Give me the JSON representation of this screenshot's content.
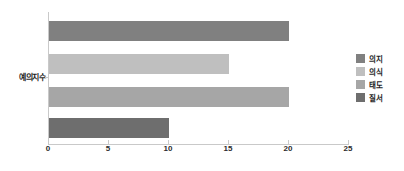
{
  "chart_data": {
    "type": "bar",
    "orientation": "horizontal",
    "title": "",
    "xlabel": "",
    "ylabel": "",
    "categories": [
      "예의지수"
    ],
    "xlim": [
      0,
      25
    ],
    "xticks": [
      0,
      5,
      10,
      15,
      20,
      25
    ],
    "xtick_labels": [
      "0",
      "5",
      "10",
      "15",
      "20",
      "25"
    ],
    "grid": false,
    "legend_position": "right",
    "series": [
      {
        "name": "의지",
        "values": [
          20
        ],
        "color": "#808080"
      },
      {
        "name": "의식",
        "values": [
          15
        ],
        "color": "#bfbfbf"
      },
      {
        "name": "태도",
        "values": [
          20
        ],
        "color": "#a6a6a6"
      },
      {
        "name": "질서",
        "values": [
          10
        ],
        "color": "#6e6e6e"
      }
    ]
  },
  "axis": {
    "category_label": "예의지수",
    "line_color": "#c9c9c9"
  },
  "legend": {
    "items": [
      {
        "label": "의지",
        "color": "#808080"
      },
      {
        "label": "의식",
        "color": "#bfbfbf"
      },
      {
        "label": "태도",
        "color": "#a6a6a6"
      },
      {
        "label": "질서",
        "color": "#6e6e6e"
      }
    ]
  }
}
